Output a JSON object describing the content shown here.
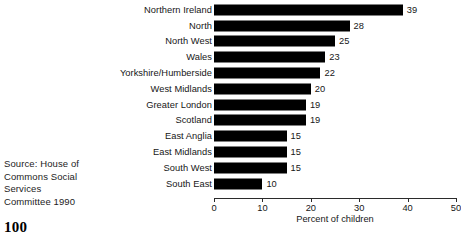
{
  "source_note": {
    "lines": [
      "Source: House of",
      "Commons Social",
      "Services",
      "Committee 1990"
    ]
  },
  "page_number": "100",
  "chart_data": {
    "type": "bar",
    "orientation": "horizontal",
    "title": "",
    "subtitle": "",
    "xlabel": "Percent of children",
    "ylabel": "",
    "xlim": [
      0,
      50
    ],
    "xticks": [
      0,
      10,
      20,
      30,
      40,
      50
    ],
    "xtick_labels": [
      "0",
      "10",
      "20",
      "30",
      "40",
      "50"
    ],
    "grid": false,
    "legend": false,
    "bar_color": "#000000",
    "categories": [
      "Northern Ireland",
      "North",
      "North West",
      "Wales",
      "Yorkshire/Humberside",
      "West Midlands",
      "Greater London",
      "Scotland",
      "East Anglia",
      "East Midlands",
      "South West",
      "South East"
    ],
    "values": [
      39,
      28,
      25,
      23,
      22,
      20,
      19,
      19,
      15,
      15,
      15,
      10
    ],
    "value_labels": [
      "39",
      "28",
      "25",
      "23",
      "22",
      "20",
      "19",
      "19",
      "15",
      "15",
      "15",
      "10"
    ]
  }
}
